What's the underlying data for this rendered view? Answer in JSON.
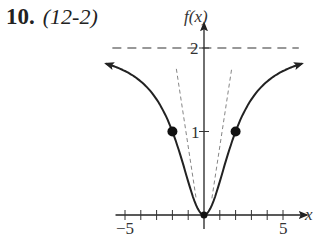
{
  "problem": {
    "number": "10.",
    "section": "(12-2)"
  },
  "chart_data": {
    "type": "line",
    "title": "",
    "xlabel": "x",
    "ylabel": "f(x)",
    "xlim": [
      -5.6,
      6.5
    ],
    "ylim": [
      0,
      2.2
    ],
    "x_tick_labels": [
      "−5",
      "5"
    ],
    "y_tick_labels": [
      "1",
      "2"
    ],
    "x_ticks": [
      -5,
      -4,
      -3,
      -2,
      -1,
      1,
      2,
      3,
      4,
      5
    ],
    "grid": false,
    "legend": null,
    "series": [
      {
        "name": "f(x)",
        "style": "solid",
        "formula": "2x^2/(x^2+4)",
        "x": [
          -6,
          -5,
          -4,
          -3,
          -2,
          -1,
          0,
          1,
          2,
          3,
          4,
          5,
          6
        ],
        "y": [
          1.8,
          1.72,
          1.6,
          1.38,
          1.0,
          0.4,
          0,
          0.4,
          1.0,
          1.38,
          1.6,
          1.72,
          1.8
        ]
      },
      {
        "name": "asymptote",
        "style": "dashed",
        "x": [
          -5.8,
          6.0
        ],
        "y": [
          2,
          2
        ]
      },
      {
        "name": "dashed-left",
        "style": "dashed",
        "x": [
          -1.75,
          -0.5
        ],
        "y": [
          1.75,
          0.2
        ]
      },
      {
        "name": "dashed-right",
        "style": "dashed",
        "x": [
          0.5,
          1.75
        ],
        "y": [
          0.2,
          1.75
        ]
      }
    ],
    "points": [
      {
        "x": -2,
        "y": 1,
        "filled": true
      },
      {
        "x": 0,
        "y": 0,
        "filled": true
      },
      {
        "x": 2,
        "y": 1,
        "filled": true
      }
    ]
  }
}
